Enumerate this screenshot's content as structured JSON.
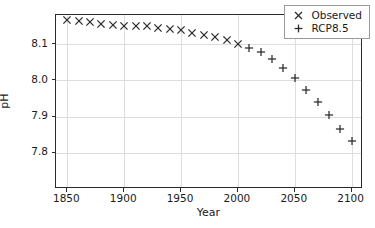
{
  "chart_data": {
    "type": "scatter",
    "title": "",
    "xlabel": "Year",
    "ylabel": "pH",
    "xlim": [
      1840,
      2110
    ],
    "ylim": [
      7.7,
      8.18
    ],
    "xticks": [
      1850,
      1900,
      1950,
      2000,
      2050,
      2100
    ],
    "yticks": [
      8.1,
      8.0,
      7.9,
      7.8
    ],
    "xticklabels": [
      "1850",
      "1900",
      "1950",
      "2000",
      "2050",
      "2100"
    ],
    "yticklabels": [
      "8.1",
      "8.0",
      "7.9",
      "7.8"
    ],
    "grid": true,
    "legend_position": "upper right",
    "series": [
      {
        "name": "Observed",
        "marker": "x",
        "color": "#2b2b2b",
        "x": [
          1850,
          1860,
          1870,
          1880,
          1890,
          1900,
          1910,
          1920,
          1930,
          1940,
          1950,
          1960,
          1970,
          1980,
          1990,
          2000
        ],
        "y": [
          8.165,
          8.163,
          8.16,
          8.156,
          8.152,
          8.151,
          8.15,
          8.149,
          8.145,
          8.142,
          8.138,
          8.131,
          8.125,
          8.118,
          8.11,
          8.101
        ]
      },
      {
        "name": "RCP8.5",
        "marker": "+",
        "color": "#2b2b2b",
        "x": [
          2010,
          2020,
          2030,
          2040,
          2050,
          2060,
          2070,
          2080,
          2090,
          2100
        ],
        "y": [
          8.089,
          8.077,
          8.058,
          8.033,
          8.005,
          7.973,
          7.941,
          7.903,
          7.866,
          7.833
        ]
      }
    ]
  },
  "legend": {
    "entries": [
      {
        "label": "Observed",
        "marker": "×"
      },
      {
        "label": "RCP8.5",
        "marker": "+"
      }
    ]
  },
  "axes": {
    "x_title": "Year",
    "y_title": "pH"
  }
}
